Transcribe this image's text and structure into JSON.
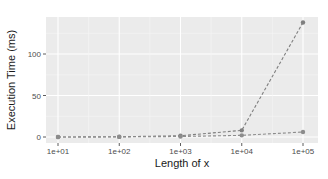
{
  "chart_data": {
    "type": "line",
    "title": "",
    "xlabel": "Length of x",
    "ylabel": "Execution Time (ms)",
    "x": [
      "1e+01",
      "1e+02",
      "1e+03",
      "1e+04",
      "1e+05"
    ],
    "x_scale": "log10",
    "ylim": [
      0,
      140
    ],
    "yticks": [
      0,
      50,
      100
    ],
    "grid": true,
    "legend": "none visible",
    "series": [
      {
        "name": "series_1",
        "values": [
          0,
          0.3,
          1.5,
          8,
          138
        ],
        "color": "#7f7f7f",
        "linestyle": "dashed"
      },
      {
        "name": "series_2",
        "values": [
          0,
          0.1,
          0.6,
          2,
          6
        ],
        "color": "#8c8c8c",
        "linestyle": "dashed"
      }
    ]
  },
  "axes": {
    "x_title": "Length of x",
    "y_title": "Execution Time (ms)",
    "x_ticks": [
      "1e+01",
      "1e+02",
      "1e+03",
      "1e+04",
      "1e+05"
    ],
    "y_ticks": [
      "0",
      "50",
      "100"
    ]
  },
  "colors": {
    "panel": "#ebebeb",
    "grid": "#ffffff",
    "points": "#7f7f7f"
  }
}
